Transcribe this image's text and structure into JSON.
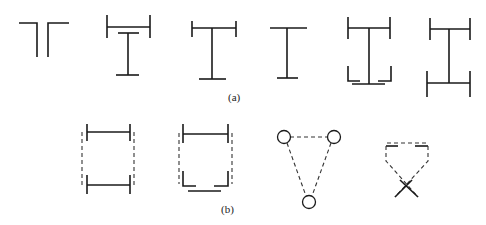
{
  "figure": {
    "row_a": {
      "label": "(a)",
      "shapes": [
        "two-angles-back-to-back",
        "plate-with-tee-below",
        "tee-with-flanged-top",
        "tee-section",
        "i-section-with-bottom-angles",
        "i-section-with-flanged-ends"
      ]
    },
    "row_b": {
      "label": "(b)",
      "shapes": [
        "two-flanges-dashed-lacing",
        "flange-and-angles-dashed-lacing",
        "three-node-dashed-triangle",
        "crossed-angles-dashed-top"
      ]
    }
  }
}
